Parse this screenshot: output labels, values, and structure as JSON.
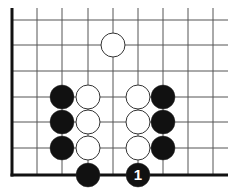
{
  "diagram": {
    "type": "go-board-corner",
    "grid": {
      "columns_x": [
        12,
        37,
        62,
        88,
        113,
        138,
        163,
        188,
        213
      ],
      "rows_y": [
        20,
        45,
        71,
        97,
        122,
        148,
        175
      ],
      "top_y": 8,
      "right_x": 228,
      "left_edge_x": 12,
      "bottom_edge_y": 175,
      "line_color": "#555555",
      "edge_color": "#111111"
    },
    "stone_radius": 12,
    "stones": [
      {
        "color": "white",
        "col": 4,
        "row": 1
      },
      {
        "color": "black",
        "col": 2,
        "row": 3
      },
      {
        "color": "white",
        "col": 3,
        "row": 3
      },
      {
        "color": "white",
        "col": 5,
        "row": 3
      },
      {
        "color": "black",
        "col": 6,
        "row": 3
      },
      {
        "color": "black",
        "col": 2,
        "row": 4
      },
      {
        "color": "white",
        "col": 3,
        "row": 4
      },
      {
        "color": "white",
        "col": 5,
        "row": 4
      },
      {
        "color": "black",
        "col": 6,
        "row": 4
      },
      {
        "color": "black",
        "col": 2,
        "row": 5
      },
      {
        "color": "white",
        "col": 3,
        "row": 5
      },
      {
        "color": "white",
        "col": 5,
        "row": 5
      },
      {
        "color": "black",
        "col": 6,
        "row": 5
      },
      {
        "color": "black",
        "col": 3,
        "row": 6
      },
      {
        "color": "black",
        "col": 5,
        "row": 6,
        "label": "1"
      }
    ],
    "colors": {
      "black_stone": "#111111",
      "white_stone": "#ffffff",
      "stone_outline": "#333333",
      "label_text": "#ffffff"
    }
  }
}
